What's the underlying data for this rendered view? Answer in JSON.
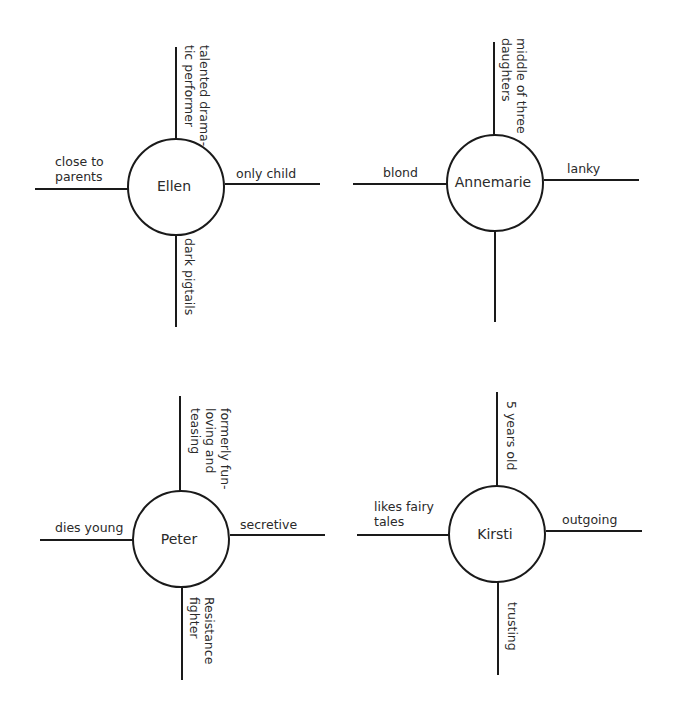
{
  "diagrams": [
    {
      "name": "Ellen",
      "top": [
        "talented drama-",
        "tic performer"
      ],
      "left": [
        "close to",
        "parents"
      ],
      "right": [
        "only child"
      ],
      "bottom": [
        "dark pigtails"
      ]
    },
    {
      "name": "Annemarie",
      "top": [
        "middle of three",
        "daughters"
      ],
      "left": [
        "blond"
      ],
      "right": [
        "lanky"
      ],
      "bottom": []
    },
    {
      "name": "Peter",
      "top": [
        "formerly fun-",
        "loving and",
        "teasing"
      ],
      "left": [
        "dies young"
      ],
      "right": [
        "secretive"
      ],
      "bottom": [
        "Resistance",
        "fighter"
      ]
    },
    {
      "name": "Kirsti",
      "top": [
        "5 years old"
      ],
      "left": [
        "likes fairy",
        "tales"
      ],
      "right": [
        "outgoing"
      ],
      "bottom": [
        "trusting"
      ]
    }
  ]
}
